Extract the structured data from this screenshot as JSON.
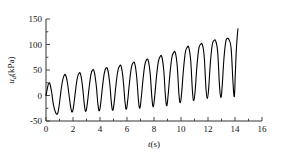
{
  "chart_data": {
    "type": "line",
    "title": "",
    "xlabel": "t(s)",
    "ylabel": "u_d(kPa)",
    "ylabel_parts": {
      "symbol": "u",
      "subscript": "d",
      "unit": "(kPa)"
    },
    "xlim": [
      0,
      16
    ],
    "ylim": [
      -50,
      150
    ],
    "xticks": [
      0,
      2,
      4,
      6,
      8,
      10,
      12,
      14,
      16
    ],
    "xtick_labels": [
      "0",
      "2",
      "4",
      "6",
      "8",
      "10",
      "12",
      "14",
      "16"
    ],
    "yticks": [
      -50,
      0,
      50,
      100,
      150
    ],
    "ytick_labels": [
      "-50",
      "0",
      "50",
      "100",
      "150"
    ],
    "minor_tick_interval_x": 1,
    "minor_tick_interval_y": 25,
    "grid": false,
    "legend": null,
    "line_color": "#000000",
    "line_width": 1.1,
    "axis_color": "#333333",
    "series": [
      {
        "name": "excess pore water pressure",
        "x": [
          0.0,
          0.1,
          0.2,
          0.3,
          0.42,
          0.55,
          0.7,
          0.85,
          0.95,
          1.05,
          1.18,
          1.32,
          1.45,
          1.58,
          1.72,
          1.85,
          1.95,
          2.05,
          2.18,
          2.32,
          2.45,
          2.58,
          2.72,
          2.85,
          2.95,
          3.05,
          3.18,
          3.32,
          3.45,
          3.58,
          3.72,
          3.85,
          3.95,
          4.05,
          4.18,
          4.32,
          4.45,
          4.58,
          4.72,
          4.85,
          4.95,
          5.05,
          5.18,
          5.32,
          5.45,
          5.58,
          5.72,
          5.85,
          5.95,
          6.05,
          6.18,
          6.32,
          6.45,
          6.58,
          6.72,
          6.85,
          6.95,
          7.05,
          7.18,
          7.32,
          7.45,
          7.58,
          7.72,
          7.85,
          7.95,
          8.05,
          8.18,
          8.32,
          8.45,
          8.58,
          8.72,
          8.85,
          8.95,
          9.05,
          9.18,
          9.32,
          9.45,
          9.58,
          9.72,
          9.85,
          9.95,
          10.05,
          10.18,
          10.32,
          10.45,
          10.58,
          10.72,
          10.85,
          10.95,
          11.05,
          11.18,
          11.32,
          11.45,
          11.58,
          11.72,
          11.85,
          11.95,
          12.05,
          12.18,
          12.32,
          12.45,
          12.58,
          12.72,
          12.85,
          12.95,
          13.05,
          13.18,
          13.32,
          13.45,
          13.58,
          13.72,
          13.85,
          13.95,
          14.02,
          14.1,
          14.18,
          14.22
        ],
        "y": [
          0,
          14,
          24,
          22,
          6,
          -18,
          -33,
          -36,
          -24,
          -4,
          22,
          38,
          40,
          26,
          -2,
          -26,
          -32,
          -20,
          8,
          34,
          44,
          40,
          14,
          -20,
          -31,
          -18,
          12,
          40,
          50,
          46,
          20,
          -18,
          -30,
          -16,
          16,
          44,
          54,
          50,
          24,
          -16,
          -29,
          -14,
          20,
          48,
          58,
          56,
          30,
          -12,
          -27,
          -10,
          24,
          54,
          64,
          62,
          36,
          -10,
          -25,
          -6,
          30,
          60,
          70,
          68,
          42,
          -6,
          -22,
          -2,
          36,
          66,
          76,
          76,
          50,
          -2,
          -20,
          2,
          42,
          74,
          84,
          84,
          58,
          2,
          -14,
          6,
          50,
          84,
          94,
          94,
          68,
          8,
          -10,
          10,
          58,
          92,
          100,
          100,
          76,
          14,
          -6,
          14,
          66,
          100,
          108,
          106,
          84,
          20,
          -4,
          18,
          72,
          106,
          112,
          108,
          90,
          26,
          -2,
          40,
          90,
          120,
          131
        ]
      }
    ]
  },
  "geometry": {
    "plot_left": 46,
    "plot_right": 262,
    "plot_top": 19,
    "plot_bottom": 121
  }
}
